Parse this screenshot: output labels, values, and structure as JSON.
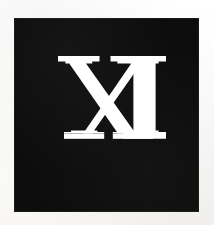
{
  "page": {
    "width": 214,
    "height": 225,
    "background_color": "#fdfdfb"
  },
  "plate": {
    "name": "numeral-plate",
    "background_color": "#090909",
    "left": 14,
    "top": 18,
    "width": 185,
    "height": 194
  },
  "numeral": {
    "text": "XI",
    "value": "11",
    "color": "#ffffff",
    "style": "serif-roman-numeral",
    "left": 58,
    "top": 56,
    "width": 94,
    "height": 83,
    "letters": [
      {
        "glyph": "X",
        "name": "letter-x"
      },
      {
        "glyph": "I",
        "name": "letter-i"
      }
    ]
  }
}
